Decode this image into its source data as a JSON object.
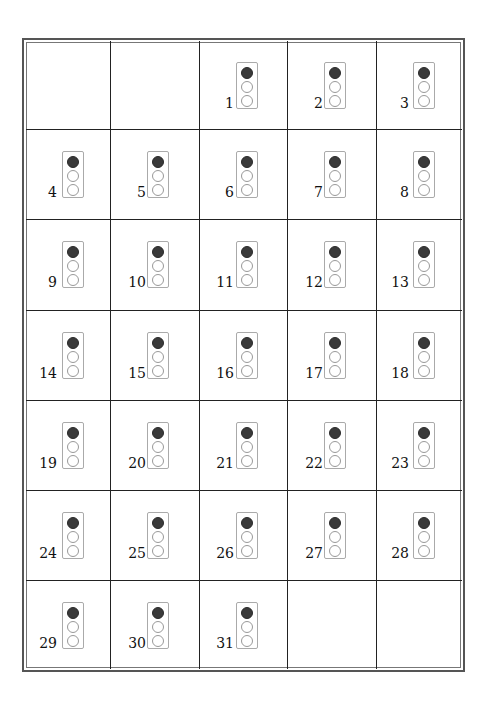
{
  "calendar": {
    "columns": 5,
    "rows": 7,
    "leading_empty_cells": 2,
    "trailing_empty_cells": 2,
    "lamp_colors": {
      "on": "#3a3a3a",
      "off": "#ffffff"
    },
    "days": [
      {
        "n": "1",
        "lamps": [
          "on",
          "off",
          "off"
        ]
      },
      {
        "n": "2",
        "lamps": [
          "on",
          "off",
          "off"
        ]
      },
      {
        "n": "3",
        "lamps": [
          "on",
          "off",
          "off"
        ]
      },
      {
        "n": "4",
        "lamps": [
          "on",
          "off",
          "off"
        ]
      },
      {
        "n": "5",
        "lamps": [
          "on",
          "off",
          "off"
        ]
      },
      {
        "n": "6",
        "lamps": [
          "on",
          "off",
          "off"
        ]
      },
      {
        "n": "7",
        "lamps": [
          "on",
          "off",
          "off"
        ]
      },
      {
        "n": "8",
        "lamps": [
          "on",
          "off",
          "off"
        ]
      },
      {
        "n": "9",
        "lamps": [
          "on",
          "off",
          "off"
        ]
      },
      {
        "n": "10",
        "lamps": [
          "on",
          "off",
          "off"
        ]
      },
      {
        "n": "11",
        "lamps": [
          "on",
          "off",
          "off"
        ]
      },
      {
        "n": "12",
        "lamps": [
          "on",
          "off",
          "off"
        ]
      },
      {
        "n": "13",
        "lamps": [
          "on",
          "off",
          "off"
        ]
      },
      {
        "n": "14",
        "lamps": [
          "on",
          "off",
          "off"
        ]
      },
      {
        "n": "15",
        "lamps": [
          "on",
          "off",
          "off"
        ]
      },
      {
        "n": "16",
        "lamps": [
          "on",
          "off",
          "off"
        ]
      },
      {
        "n": "17",
        "lamps": [
          "on",
          "off",
          "off"
        ]
      },
      {
        "n": "18",
        "lamps": [
          "on",
          "off",
          "off"
        ]
      },
      {
        "n": "19",
        "lamps": [
          "on",
          "off",
          "off"
        ]
      },
      {
        "n": "20",
        "lamps": [
          "on",
          "off",
          "off"
        ]
      },
      {
        "n": "21",
        "lamps": [
          "on",
          "off",
          "off"
        ]
      },
      {
        "n": "22",
        "lamps": [
          "on",
          "off",
          "off"
        ]
      },
      {
        "n": "23",
        "lamps": [
          "on",
          "off",
          "off"
        ]
      },
      {
        "n": "24",
        "lamps": [
          "on",
          "off",
          "off"
        ]
      },
      {
        "n": "25",
        "lamps": [
          "on",
          "off",
          "off"
        ]
      },
      {
        "n": "26",
        "lamps": [
          "on",
          "off",
          "off"
        ]
      },
      {
        "n": "27",
        "lamps": [
          "on",
          "off",
          "off"
        ]
      },
      {
        "n": "28",
        "lamps": [
          "on",
          "off",
          "off"
        ]
      },
      {
        "n": "29",
        "lamps": [
          "on",
          "off",
          "off"
        ]
      },
      {
        "n": "30",
        "lamps": [
          "on",
          "off",
          "off"
        ]
      },
      {
        "n": "31",
        "lamps": [
          "on",
          "off",
          "off"
        ]
      }
    ]
  }
}
